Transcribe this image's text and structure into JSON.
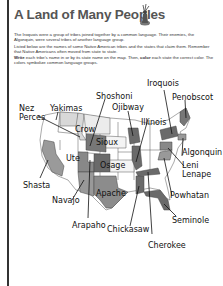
{
  "worksheet": {
    "title": "A Land of Many Peoples",
    "title_icon": "native-figure-icon",
    "paragraph1": "The Iroquois were a group of tribes joined together by a common language. Their enemies, the Algonquin, were several tribes of another language group.",
    "paragraph2": "Listed below are the names of some Native American tribes and the states that claim them. Remember that Native Americans often moved from state to state.",
    "instruction_write_bold": "Write",
    "instruction_part1": " each tribe's name in or by its state name on the map. Then, ",
    "instruction_color_bold": "color",
    "instruction_part2": " each state the correct color. The colors symbolize common language groups."
  },
  "map": {
    "tribes": [
      {
        "name": "Nez Perces",
        "line1": "Nez",
        "line2": "Perces"
      },
      {
        "name": "Yakimas"
      },
      {
        "name": "Shoshoni"
      },
      {
        "name": "Ojibway"
      },
      {
        "name": "Iroquois"
      },
      {
        "name": "Penobscot"
      },
      {
        "name": "Crow"
      },
      {
        "name": "Sioux"
      },
      {
        "name": "Illinois"
      },
      {
        "name": "Algonquin"
      },
      {
        "name": "Ute"
      },
      {
        "name": "Osage"
      },
      {
        "name": "Leni Lenape",
        "line1": "Leni",
        "line2": "Lenape"
      },
      {
        "name": "Shasta"
      },
      {
        "name": "Navajo"
      },
      {
        "name": "Apache"
      },
      {
        "name": "Powhatan"
      },
      {
        "name": "Arapaho"
      },
      {
        "name": "Chickasaw"
      },
      {
        "name": "Seminole"
      },
      {
        "name": "Cherokee"
      }
    ],
    "colors": {
      "dark": "#6a6a6a",
      "medium": "#8c8c8c",
      "light": "#d8d8d8",
      "outline": "#444444"
    }
  }
}
